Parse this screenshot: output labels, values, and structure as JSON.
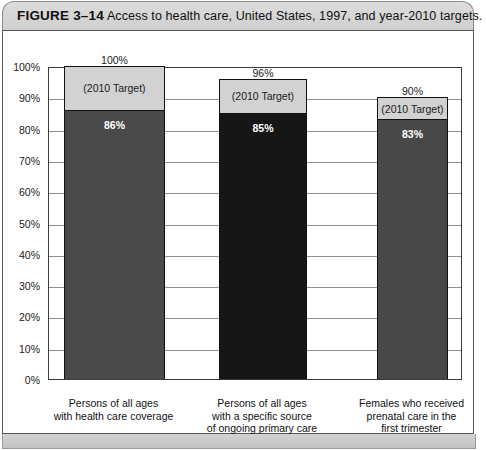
{
  "figure": {
    "number": "FIGURE 3–14",
    "caption": "Access to health care, United States, 1997, and year-2010 targets."
  },
  "chart_data": {
    "type": "bar",
    "title": "Access to health care, United States, 1997, and year-2010 targets.",
    "xlabel": "",
    "ylabel": "",
    "ylim": [
      0,
      100
    ],
    "grid": true,
    "legend": "none",
    "stacked_target": true,
    "categories": [
      "Persons of all ages with health care coverage",
      "Persons of all ages with a specific source of ongoing primary care",
      "Females who received prenatal care in the first trimester"
    ],
    "category_lines": [
      [
        "Persons of all ages",
        "with health care coverage"
      ],
      [
        "Persons of all ages",
        "with a specific source",
        "of ongoing primary care"
      ],
      [
        "Females who received",
        "prenatal care in the",
        "first trimester"
      ]
    ],
    "series": [
      {
        "name": "1997 actual",
        "values": [
          86,
          85,
          83
        ],
        "value_labels": [
          "86%",
          "85%",
          "83%"
        ],
        "colors": [
          "#4a4a4a",
          "#161616",
          "#484848"
        ]
      },
      {
        "name": "2010 Target",
        "values": [
          100,
          96,
          90
        ],
        "value_labels": [
          "100%",
          "96%",
          "90%"
        ],
        "segment_label": "(2010 Target)",
        "color": "#d2d2d2"
      }
    ],
    "yticks": [
      0,
      10,
      20,
      30,
      40,
      50,
      60,
      70,
      80,
      90,
      100
    ],
    "ytick_labels": [
      "0%",
      "10%",
      "20%",
      "30%",
      "40%",
      "50%",
      "60%",
      "70%",
      "80%",
      "90%",
      "100%"
    ]
  }
}
